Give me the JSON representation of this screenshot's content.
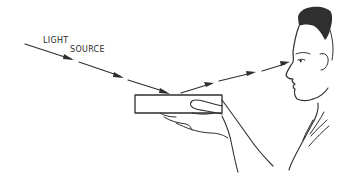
{
  "diagram": {
    "labels": {
      "light_source_line1": "LIGHT",
      "light_source_line2": "SOURCE"
    },
    "elements": [
      "incident-light-ray",
      "reflecting-block",
      "hand-holding-block",
      "reflected-light-ray",
      "observer-head-profile"
    ],
    "colors": {
      "ink": "#2f2f2f",
      "background": "#ffffff"
    }
  }
}
